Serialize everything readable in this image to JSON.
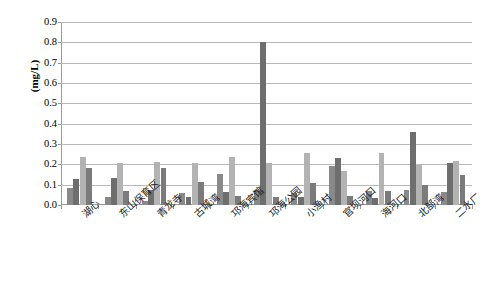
{
  "chart_data": {
    "type": "bar",
    "title": "",
    "subtitle": "",
    "xlabel": "",
    "ylabel": "(mg/L)",
    "ylim": [
      0.0,
      0.9
    ],
    "ytick_labels": [
      "0.9",
      "0.8",
      "0.7",
      "0.6",
      "0.5",
      "0.4",
      "0.3",
      "0.2",
      "0.1",
      "0.0"
    ],
    "ytick_values": [
      0.9,
      0.8,
      0.7,
      0.6,
      0.5,
      0.4,
      0.3,
      0.2,
      0.1,
      0.0
    ],
    "grid": true,
    "legend": "none",
    "categories": [
      "湖心",
      "东山保育区",
      "青龙寺",
      "古城湾",
      "邛海宾馆",
      "邛海公园",
      "小渔村",
      "官坝河口",
      "海河口",
      "北部湾",
      "二水厂"
    ],
    "series": [
      {
        "name": "series-1",
        "color": "#898989",
        "values": [
          0.085,
          0.04,
          0.022,
          0.057,
          0.152,
          0.072,
          0.057,
          0.193,
          0.07,
          0.072,
          0.065
        ]
      },
      {
        "name": "series-2",
        "color": "#6e6e6e",
        "values": [
          0.128,
          0.133,
          0.073,
          0.038,
          0.062,
          0.8,
          0.037,
          0.23,
          0.035,
          0.358,
          0.207
        ]
      },
      {
        "name": "series-3",
        "color": "#b3b3b3",
        "values": [
          0.238,
          0.207,
          0.212,
          0.208,
          0.237,
          0.208,
          0.258,
          0.165,
          0.255,
          0.198,
          0.218
        ]
      },
      {
        "name": "series-4",
        "color": "#7b7b7b",
        "values": [
          0.182,
          0.068,
          0.183,
          0.115,
          0.043,
          0.038,
          0.11,
          0.045,
          0.07,
          0.1,
          0.147
        ]
      }
    ]
  },
  "axis": {
    "y_title": "(mg/L)"
  }
}
